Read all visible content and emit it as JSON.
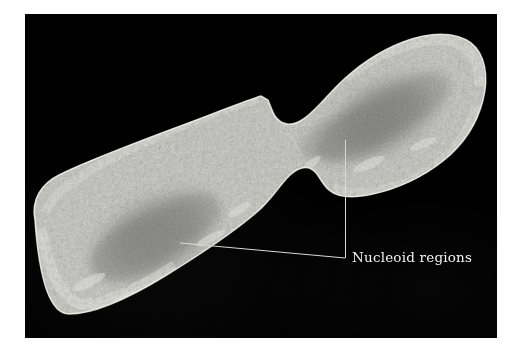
{
  "figure": {
    "kind": "electron-micrograph",
    "background_color": "#ffffff",
    "plate_color": "#000000",
    "plate": {
      "x": 25,
      "y": 14,
      "width": 472,
      "height": 324
    }
  },
  "annotations": {
    "label_text": "Nucleoid regions",
    "label_color": "#f2f2f0",
    "leader_color": "#d8d8d4",
    "leaders": [
      {
        "name": "leader-upper-cell",
        "description": "vertical line from upper-right daughter cell nucleoid down to junction",
        "points": "320,126 320,244"
      },
      {
        "name": "leader-lower-cell",
        "description": "diagonal line from lower-left daughter cell nucleoid right to junction",
        "points": "155,229 320,244"
      }
    ],
    "junction": {
      "x": 320,
      "y": 244
    }
  },
  "specimen": {
    "cells": [
      {
        "name": "lower-left-daughter-cell",
        "cytoplasm_color": "#b9b9b4",
        "wall_color": "#e9e9e4",
        "nucleoid_color": "#6e6e6a",
        "nucleoid_label": "Nucleoid region"
      },
      {
        "name": "upper-right-daughter-cell",
        "cytoplasm_color": "#b4b4af",
        "wall_color": "#e9e9e4",
        "nucleoid_color": "#6b6b67",
        "nucleoid_label": "Nucleoid region"
      }
    ],
    "septum": {
      "name": "division-septum",
      "description": "constriction between daughter cells"
    }
  }
}
